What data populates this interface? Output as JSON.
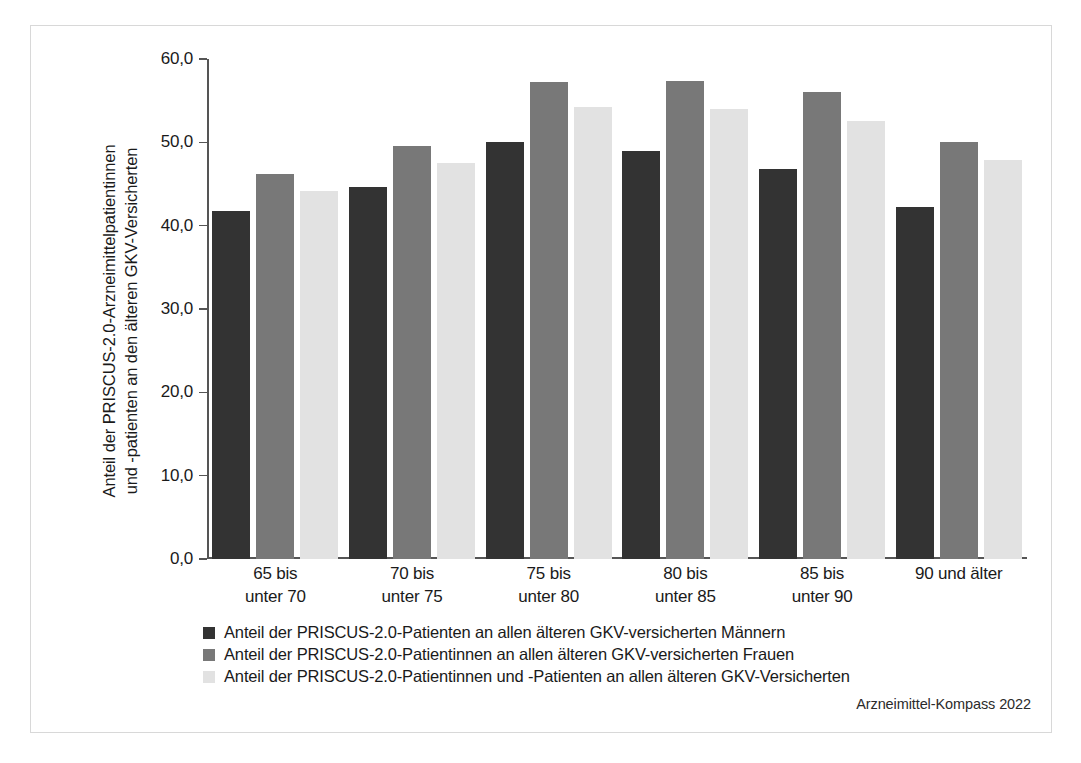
{
  "chart_data": {
    "type": "bar",
    "title": "",
    "xlabel": "",
    "ylabel": "Anteil der PRISCUS-2.0-Arzneimittelpatientinnen und -patienten an den älteren GKV-Versicherten",
    "ylabel_lines": [
      "Anteil der PRISCUS-2.0-Arzneimittelpatientinnen",
      "und -patienten an den älteren GKV-Versicherten"
    ],
    "ylim": [
      0,
      60
    ],
    "ytick_values": [
      60,
      50,
      40,
      30,
      20,
      10,
      0
    ],
    "ytick_labels": [
      "60,0",
      "50,0",
      "40,0",
      "30,0",
      "20,0",
      "10,0",
      "0,0"
    ],
    "grid": false,
    "legend_position": "below-axis-left",
    "categories": [
      "65 bis unter 70",
      "70 bis unter 75",
      "75 bis unter 80",
      "80 bis unter 85",
      "85 bis unter 90",
      "90 und älter"
    ],
    "category_lines": [
      [
        "65 bis",
        "unter 70"
      ],
      [
        "70 bis",
        "unter 75"
      ],
      [
        "75 bis",
        "unter 80"
      ],
      [
        "80 bis",
        "unter 85"
      ],
      [
        "85 bis",
        "unter 90"
      ],
      [
        "90 und älter",
        ""
      ]
    ],
    "series": [
      {
        "name": "Anteil der PRISCUS-2.0-Patienten an allen älteren GKV-versicherten Männern",
        "color": "#333333",
        "values": [
          41.8,
          44.6,
          50.0,
          49.0,
          46.8,
          42.2
        ]
      },
      {
        "name": "Anteil der PRISCUS-2.0-Patientinnen an allen älteren GKV-versicherten Frauen",
        "color": "#787878",
        "values": [
          46.2,
          49.6,
          57.2,
          57.4,
          56.0,
          50.0
        ]
      },
      {
        "name": "Anteil der PRISCUS-2.0-Patientinnen und -Patienten an allen älteren GKV-Versicherten",
        "color": "#e2e2e2",
        "values": [
          44.2,
          47.5,
          54.2,
          54.0,
          52.6,
          47.9
        ]
      }
    ]
  },
  "credit": "Arzneimittel-Kompass 2022"
}
